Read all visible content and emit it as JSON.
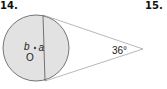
{
  "problems": [
    {
      "number": "14."
    },
    {
      "number": "15."
    }
  ],
  "diagram": {
    "circle_center_label": "O",
    "angle_a_label": "a",
    "angle_b_label": "b",
    "external_angle_label": "36°",
    "colors": {
      "circle_fill": "#e2e2e2",
      "stroke": "#555555",
      "tangent_stroke": "#999999"
    }
  }
}
